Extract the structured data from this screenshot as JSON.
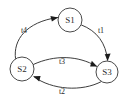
{
  "diagram": {
    "type": "state-transition-diagram",
    "background_color": "#ffffff",
    "stroke_color": "#3d3d3d",
    "text_color": "#2b2b2b",
    "nodes": [
      {
        "id": "S1",
        "label": "S1",
        "cx": 70,
        "cy": 20,
        "r": 12
      },
      {
        "id": "S2",
        "label": "S2",
        "cx": 22,
        "cy": 69,
        "r": 12
      },
      {
        "id": "S3",
        "label": "S3",
        "cx": 107,
        "cy": 72,
        "r": 11
      }
    ],
    "edges": [
      {
        "id": "t4",
        "label": "t4",
        "from": "S2",
        "to": "S1",
        "label_x": 24,
        "label_y": 31
      },
      {
        "id": "t1",
        "label": "t1",
        "from": "S1",
        "to": "S3",
        "label_x": 101,
        "label_y": 31
      },
      {
        "id": "t3",
        "label": "t3",
        "from": "S2",
        "to": "S3",
        "label_x": 62,
        "label_y": 62
      },
      {
        "id": "t2",
        "label": "t2",
        "from": "S3",
        "to": "S2",
        "label_x": 62,
        "label_y": 92
      }
    ]
  }
}
